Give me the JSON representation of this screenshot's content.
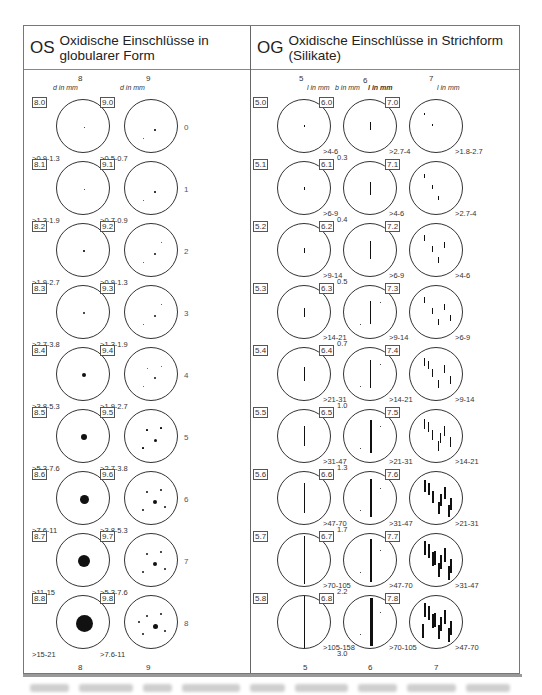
{
  "header": {
    "left": {
      "code": "OS",
      "title": "Oxidische Einschlüsse in globularer Form"
    },
    "right": {
      "code": "OG",
      "title": "Oxidische Einschlüsse in Strichform (Silikate)"
    }
  },
  "left_panel": {
    "columns": [
      {
        "number": "8",
        "unit": "d in mm"
      },
      {
        "number": "9",
        "unit": "d in mm"
      }
    ],
    "row_numbers": [
      "0",
      "1",
      "2",
      "3",
      "4",
      "5",
      "6",
      "7",
      "8"
    ],
    "plates_col8": [
      {
        "code": "8.0",
        "range": ">0.9-1.3"
      },
      {
        "code": "8.1",
        "range": ">1.3-1.9"
      },
      {
        "code": "8.2",
        "range": ">1.9-2.7"
      },
      {
        "code": "8.3",
        "range": ">2.7-3.8"
      },
      {
        "code": "8.4",
        "range": ">3.8-5.3"
      },
      {
        "code": "8.5",
        "range": ">5.3-7.6"
      },
      {
        "code": "8.6",
        "range": ">7.6-11"
      },
      {
        "code": "8.7",
        "range": ">11-15"
      },
      {
        "code": "8.8",
        "range": ">15-21"
      }
    ],
    "plates_col9": [
      {
        "code": "9.0",
        "range": ">0.5-0.7"
      },
      {
        "code": "9.1",
        "range": ">0.7-0.9"
      },
      {
        "code": "9.2",
        "range": ">0.9-1.3"
      },
      {
        "code": "9.3",
        "range": ">1.3-1.9"
      },
      {
        "code": "9.4",
        "range": ">1.9-2.7"
      },
      {
        "code": "9.5",
        "range": ">2.7-3.8"
      },
      {
        "code": "9.6",
        "range": ">3.8-5.3"
      },
      {
        "code": "9.7",
        "range": ">5.3-7.6"
      },
      {
        "code": "9.8",
        "range": ">7.6-11"
      }
    ],
    "footer_numbers": [
      "8",
      "9"
    ]
  },
  "right_panel": {
    "columns": [
      {
        "number": "5",
        "unit": "l in mm"
      },
      {
        "number": "6",
        "unit_b": "b in mm",
        "unit": "l in mm"
      },
      {
        "number": "7",
        "unit": "l in mm"
      }
    ],
    "widths_col6": [
      "0.3",
      "0.4",
      "0.5",
      "0.7",
      "1.0",
      "1.3",
      "1.7",
      "2.2",
      "3.0"
    ],
    "plates_col5": [
      {
        "code": "5.0",
        "range": ">4-6"
      },
      {
        "code": "5.1",
        "range": ">6-9"
      },
      {
        "code": "5.2",
        "range": ">9-14"
      },
      {
        "code": "5.3",
        "range": ">14-21"
      },
      {
        "code": "5.4",
        "range": ">21-31"
      },
      {
        "code": "5.5",
        "range": ">31-47"
      },
      {
        "code": "5.6",
        "range": ">47-70"
      },
      {
        "code": "5.7",
        "range": ">70-105"
      },
      {
        "code": "5.8",
        "range": ">105-158"
      }
    ],
    "plates_col6": [
      {
        "code": "6.0",
        "range": ">2.7-4"
      },
      {
        "code": "6.1",
        "range": ">4-6"
      },
      {
        "code": "6.2",
        "range": ">6-9"
      },
      {
        "code": "6.3",
        "range": ">9-14"
      },
      {
        "code": "6.4",
        "range": ">14-21"
      },
      {
        "code": "6.5",
        "range": ">21-31"
      },
      {
        "code": "6.6",
        "range": ">31-47"
      },
      {
        "code": "6.7",
        "range": ">47-70"
      },
      {
        "code": "6.8",
        "range": ">70-105"
      }
    ],
    "plates_col7": [
      {
        "code": "7.0",
        "range": ">1.8-2.7"
      },
      {
        "code": "7.1",
        "range": ">2.7-4"
      },
      {
        "code": "7.2",
        "range": ">4-6"
      },
      {
        "code": "7.3",
        "range": ">6-9"
      },
      {
        "code": "7.4",
        "range": ">9-14"
      },
      {
        "code": "7.5",
        "range": ">14-21"
      },
      {
        "code": "7.6",
        "range": ">21-31"
      },
      {
        "code": "7.7",
        "range": ">31-47"
      },
      {
        "code": "7.8",
        "range": ">47-70"
      }
    ],
    "footer_numbers": [
      "5",
      "6",
      "7"
    ]
  }
}
